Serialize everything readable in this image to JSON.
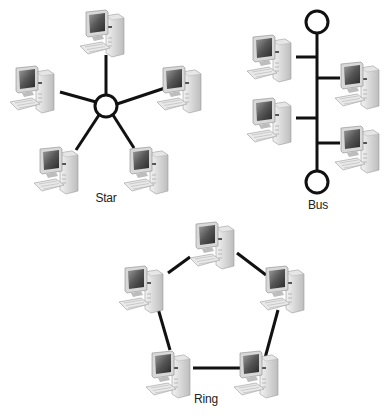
{
  "diagrams": {
    "star": {
      "label": "Star",
      "label_pos": [
        106,
        198
      ]
    },
    "bus": {
      "label": "Bus",
      "label_pos": [
        318,
        198
      ]
    },
    "ring": {
      "label": "Ring",
      "label_pos": [
        205,
        396
      ]
    }
  },
  "colors": {
    "line": "#111111",
    "background": "#ffffff"
  },
  "icons": {
    "computer": "desktop-computer-icon",
    "hub": "hub-circle",
    "terminator": "bus-terminator-circle"
  }
}
